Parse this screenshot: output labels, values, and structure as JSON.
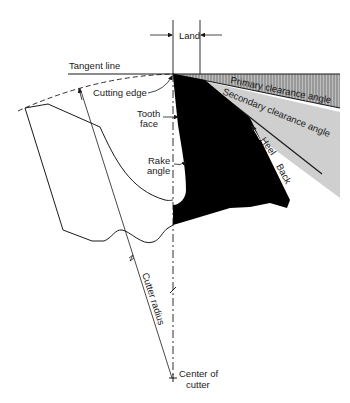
{
  "diagram": {
    "labels": {
      "land": "Land",
      "tangent_line": "Tangent line",
      "cutting_edge": "Cutting edge",
      "tooth_face_1": "Tooth",
      "tooth_face_2": "face",
      "rake_angle_1": "Rake",
      "rake_angle_2": "angle",
      "primary_clearance": "Primary clearance angle",
      "secondary_clearance": "Secondary clearance angle",
      "heel": "Heel",
      "back": "Back",
      "cutter_radius": "Cutter radius",
      "center_1": "Center of",
      "center_2": "cutter"
    },
    "colors": {
      "tooth_fill": "#000000",
      "primary_fill": "#bdbdbd",
      "secondary_fill": "#cfcfcf",
      "line": "#1a1a1a"
    }
  }
}
